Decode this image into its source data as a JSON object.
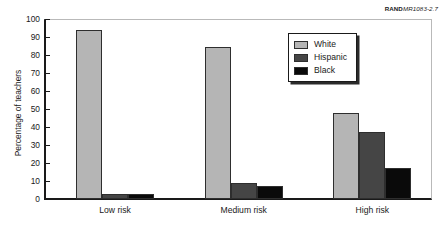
{
  "source_id": {
    "bold_part": "RAND",
    "italic_part": "MR1083-2.7"
  },
  "chart_data": {
    "type": "bar",
    "title": "",
    "subtitle": "",
    "xlabel": "",
    "ylabel": "Percentage of teachers",
    "categories": [
      "Low risk",
      "Medium risk",
      "High risk"
    ],
    "series": [
      {
        "name": "White",
        "color": "#b5b5b5",
        "values": [
          94,
          84.5,
          48
        ]
      },
      {
        "name": "Hispanic",
        "color": "#454545",
        "values": [
          3,
          9,
          37
        ]
      },
      {
        "name": "Black",
        "color": "#0a0a0a",
        "values": [
          3,
          7,
          17
        ]
      }
    ],
    "ylim": [
      0,
      100
    ],
    "ytick_labels": [
      "100",
      "90",
      "80",
      "70",
      "60",
      "50",
      "40",
      "30",
      "20",
      "10",
      "0"
    ],
    "ytick_values": [
      100,
      90,
      80,
      70,
      60,
      50,
      40,
      30,
      20,
      10,
      0
    ],
    "grid": false,
    "legend_position": "top-right"
  }
}
